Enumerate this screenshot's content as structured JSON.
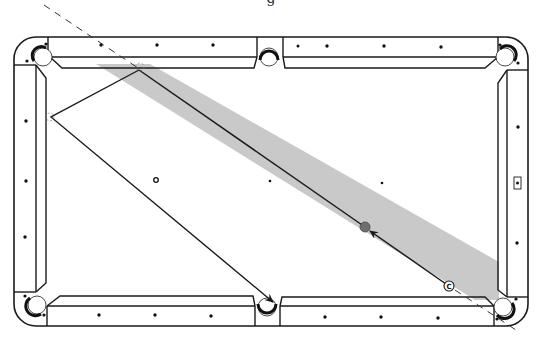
{
  "caption": "g",
  "colors": {
    "table_line": "#1a1a1a",
    "shot_band": "#c9c9c9",
    "object_ball": "#6e6e6e",
    "background": "#ffffff"
  },
  "table": {
    "outer": {
      "x": 14,
      "y": 37,
      "w": 514,
      "h": 289,
      "corner_radius": 22
    },
    "cushion_inner": {
      "x": 49,
      "y": 64,
      "w": 450,
      "h": 236
    },
    "pockets": [
      {
        "name": "top-left",
        "cx": 43,
        "cy": 57
      },
      {
        "name": "top-middle",
        "cx": 269,
        "cy": 57
      },
      {
        "name": "top-right",
        "cx": 505,
        "cy": 57
      },
      {
        "name": "bottom-left",
        "cx": 37,
        "cy": 305
      },
      {
        "name": "bottom-middle",
        "cx": 267,
        "cy": 307
      },
      {
        "name": "bottom-right",
        "cx": 503,
        "cy": 307
      }
    ],
    "diamonds_top": [
      101,
      157,
      213,
      298,
      327,
      384,
      441
    ],
    "diamonds_bottom": [
      99,
      155,
      211,
      325,
      381,
      438
    ],
    "diamonds_left": [
      121,
      181,
      237
    ],
    "diamonds_right": [
      127,
      243
    ],
    "right_marker": {
      "x": 517,
      "y": 183,
      "label": "spot"
    }
  },
  "shot": {
    "cue_ball_label": "C",
    "cue_ball": {
      "cx": 449,
      "cy": 286
    },
    "object_ball": {
      "cx": 365,
      "cy": 227
    },
    "ghost_spot": {
      "cx": 156,
      "cy": 180
    },
    "head_spot": {
      "cx": 270,
      "cy": 181
    },
    "foot_spot": {
      "cx": 382,
      "cy": 183
    },
    "bank_top": {
      "x": 139,
      "y": 70
    },
    "bank_left": {
      "x": 51,
      "y": 117
    },
    "target_pocket": {
      "x": 273,
      "y": 302
    }
  }
}
